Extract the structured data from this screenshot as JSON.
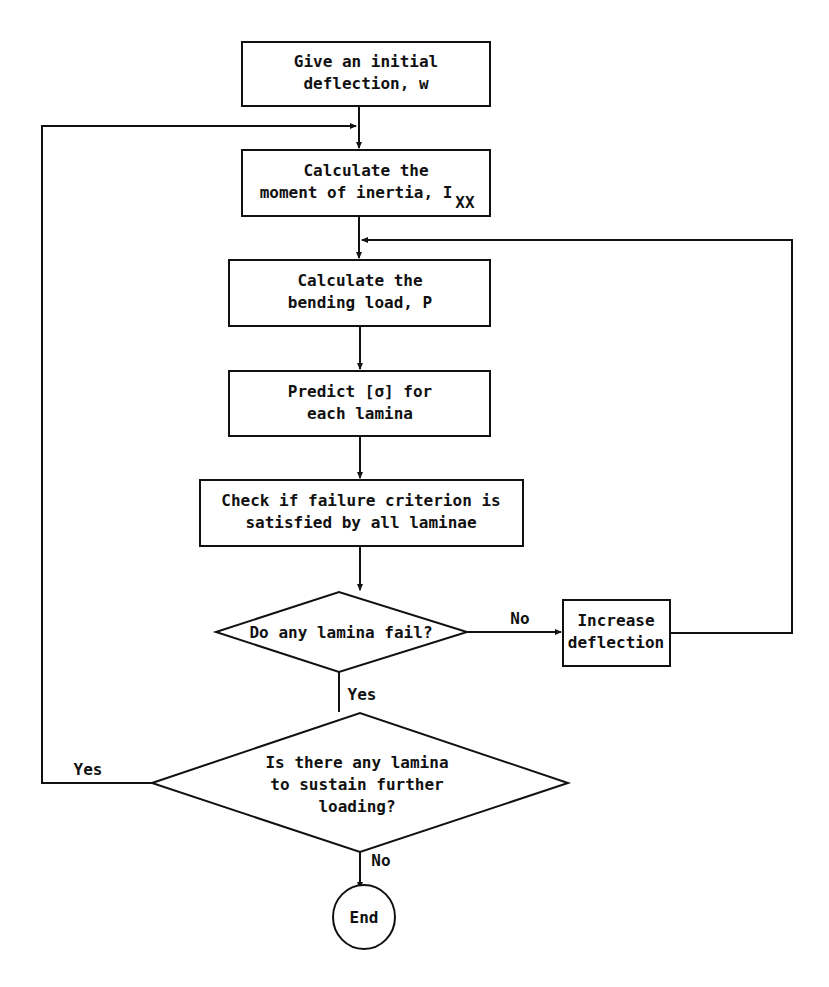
{
  "flowchart": {
    "nodes": {
      "initial_deflection": {
        "line1": "Give an initial",
        "line2": "deflection, w"
      },
      "moment_of_inertia": {
        "line1": "Calculate the",
        "line2": "moment of inertia, I",
        "subscript": "XX"
      },
      "bending_load": {
        "line1": "Calculate the",
        "line2": "bending load, P"
      },
      "predict_stress": {
        "line1": "Predict [σ] for",
        "line2": "each lamina"
      },
      "check_failure": {
        "line1": "Check if failure criterion is",
        "line2": "satisfied by all laminae"
      },
      "lamina_fail_decision": {
        "line1": "Do any lamina fail?"
      },
      "increase_deflection": {
        "line1": "Increase",
        "line2": "deflection"
      },
      "sustain_decision": {
        "line1": "Is there any lamina",
        "line2": "to sustain  further",
        "line3": "loading?"
      },
      "end": {
        "line1": "End"
      }
    },
    "edge_labels": {
      "fail_no": "No",
      "fail_yes": "Yes",
      "sustain_yes": "Yes",
      "sustain_no": "No"
    }
  }
}
